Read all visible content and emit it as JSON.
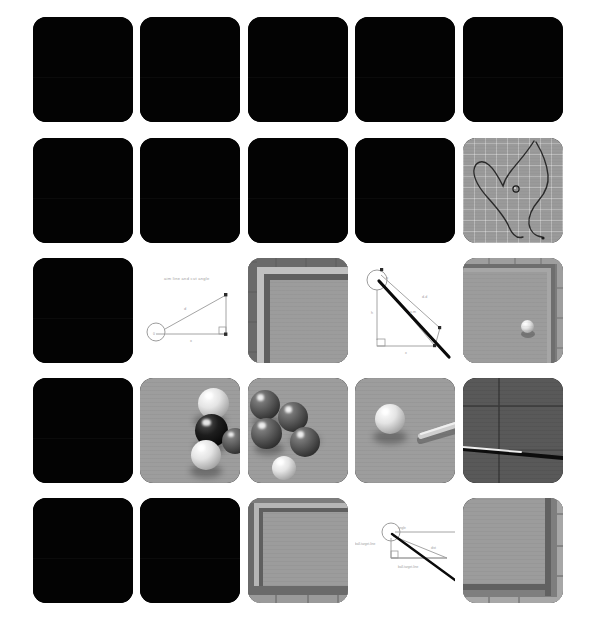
{
  "page": {
    "background_color": "#ffffff",
    "width": 607,
    "height": 634,
    "layout": "5x5-card-grid"
  },
  "palette": {
    "card_black": "#030303",
    "cloth_gray": "#9a9a9a",
    "cloth_line": "#ffffff",
    "rail_dark": "#5c5c5c",
    "rail_mid": "#7d7d7d",
    "rail_light": "#b5b5b5",
    "cue_white": "#e8e8e8",
    "cue_dark": "#0a0a0a",
    "diagram_line": "#9a9a9a",
    "diagram_text": "#8a8a8a"
  },
  "grid": {
    "columns": 5,
    "rows": 5,
    "card_width": 100,
    "card_height": 105,
    "col_x": [
      33,
      140,
      248,
      355,
      463
    ],
    "row_y": [
      17,
      138,
      258,
      378,
      498
    ],
    "corner_radius": 13
  },
  "cards": [
    {
      "id": "r1c1",
      "row": 1,
      "col": 1,
      "kind": "blank",
      "label": "blank-frame"
    },
    {
      "id": "r1c2",
      "row": 1,
      "col": 2,
      "kind": "blank",
      "label": "blank-frame"
    },
    {
      "id": "r1c3",
      "row": 1,
      "col": 3,
      "kind": "blank",
      "label": "blank-frame"
    },
    {
      "id": "r1c4",
      "row": 1,
      "col": 4,
      "kind": "blank",
      "label": "blank-frame"
    },
    {
      "id": "r1c5",
      "row": 1,
      "col": 5,
      "kind": "blank",
      "label": "blank-frame"
    },
    {
      "id": "r2c1",
      "row": 2,
      "col": 1,
      "kind": "blank",
      "label": "blank-frame"
    },
    {
      "id": "r2c2",
      "row": 2,
      "col": 2,
      "kind": "blank",
      "label": "blank-frame"
    },
    {
      "id": "r2c3",
      "row": 2,
      "col": 3,
      "kind": "blank",
      "label": "blank-frame"
    },
    {
      "id": "r2c4",
      "row": 2,
      "col": 4,
      "kind": "blank",
      "label": "blank-frame"
    },
    {
      "id": "r2c5",
      "row": 2,
      "col": 5,
      "kind": "path-trace",
      "label": "ball-path-trace-on-cloth"
    },
    {
      "id": "r3c1",
      "row": 3,
      "col": 1,
      "kind": "blank",
      "label": "blank-frame"
    },
    {
      "id": "r3c2",
      "row": 3,
      "col": 2,
      "kind": "diagram-a",
      "label": "aim-angle-diagram"
    },
    {
      "id": "r3c3",
      "row": 3,
      "col": 3,
      "kind": "table-corner-tl",
      "label": "pool-table-corner"
    },
    {
      "id": "r3c4",
      "row": 3,
      "col": 4,
      "kind": "diagram-b",
      "label": "cue-angle-diagram"
    },
    {
      "id": "r3c5",
      "row": 3,
      "col": 5,
      "kind": "table-corner-ball",
      "label": "pool-table-corner-with-ball"
    },
    {
      "id": "r4c1",
      "row": 4,
      "col": 1,
      "kind": "blank",
      "label": "blank-frame"
    },
    {
      "id": "r4c2",
      "row": 4,
      "col": 2,
      "kind": "balls-cluster-a",
      "label": "billiard-balls-cluster"
    },
    {
      "id": "r4c3",
      "row": 4,
      "col": 3,
      "kind": "balls-cluster-b",
      "label": "billiard-balls-cluster"
    },
    {
      "id": "r4c4",
      "row": 4,
      "col": 4,
      "kind": "cueball-and-stick",
      "label": "cue-ball-and-cue-stick"
    },
    {
      "id": "r4c5",
      "row": 4,
      "col": 5,
      "kind": "closeup-cue",
      "label": "cue-stick-closeup-on-cloth"
    },
    {
      "id": "r5c1",
      "row": 5,
      "col": 1,
      "kind": "blank",
      "label": "blank-frame"
    },
    {
      "id": "r5c2",
      "row": 5,
      "col": 2,
      "kind": "blank",
      "label": "blank-frame"
    },
    {
      "id": "r5c3",
      "row": 5,
      "col": 3,
      "kind": "table-corner-tl2",
      "label": "pool-table-corner"
    },
    {
      "id": "r5c4",
      "row": 5,
      "col": 4,
      "kind": "diagram-c",
      "label": "cut-angle-diagram"
    },
    {
      "id": "r5c5",
      "row": 5,
      "col": 5,
      "kind": "table-corner-br",
      "label": "pool-table-corner"
    }
  ],
  "diagram_a": {
    "title": "aim line and cut angle",
    "labels": {
      "hyp": "d",
      "base": "x",
      "vertex": "θ"
    }
  },
  "diagram_b": {
    "labels": {
      "hyp": "d-d",
      "mid": "y-m",
      "vert": "h",
      "base": "x"
    }
  },
  "diagram_c": {
    "labels": {
      "left": "ball-target-line",
      "bottom": "ball-target-line",
      "right": "dist",
      "top": "angle"
    }
  },
  "path_trace": {
    "description": "single long looping dark trajectory with a small ball marker near the centre",
    "ball_marker": true
  }
}
